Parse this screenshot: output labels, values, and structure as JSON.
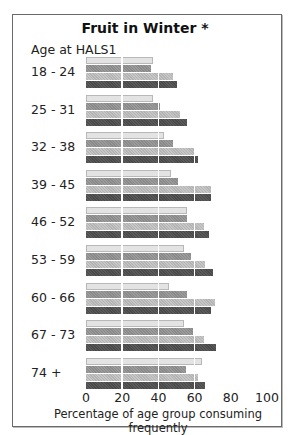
{
  "chart_data": {
    "type": "bar",
    "orientation": "horizontal",
    "title": "Fruit in Winter *",
    "ylabel": "Age at HALS1",
    "xlabel": "Percentage of age group consuming frequently",
    "xlim": [
      0,
      100
    ],
    "xticks": [
      "0",
      "20",
      "40",
      "60",
      "80",
      "100"
    ],
    "grid": "vertical white lines at 20, 40, 60, 80",
    "legend": "none shown",
    "categories": [
      "18 - 24",
      "25 - 31",
      "32 - 38",
      "39 - 45",
      "46 - 52",
      "53 - 59",
      "60 - 66",
      "67 - 73",
      "74 +"
    ],
    "series": [
      {
        "name": "series 1 (lightest)",
        "color": "#e3e3e3",
        "values": [
          37,
          37,
          43,
          47,
          56,
          54,
          46,
          54,
          64
        ]
      },
      {
        "name": "series 2 (medium)",
        "color": "#929292",
        "values": [
          36,
          41,
          48,
          51,
          56,
          58,
          56,
          59,
          55
        ]
      },
      {
        "name": "series 3 (light-medium)",
        "color": "#bdbdbd",
        "values": [
          48,
          52,
          60,
          69,
          65,
          66,
          71,
          65,
          62
        ]
      },
      {
        "name": "series 4 (darkest)",
        "color": "#525252",
        "values": [
          50,
          56,
          62,
          69,
          68,
          70,
          69,
          72,
          66
        ]
      }
    ]
  }
}
